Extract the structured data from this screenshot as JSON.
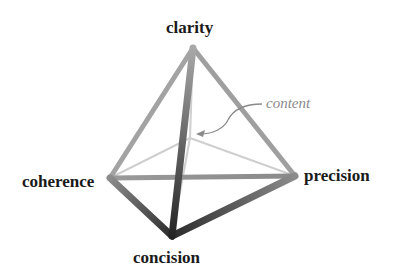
{
  "diagram": {
    "type": "tetrahedron",
    "vertices": {
      "top": {
        "label": "clarity"
      },
      "left": {
        "label": "coherence"
      },
      "right": {
        "label": "precision"
      },
      "bottom": {
        "label": "concision"
      }
    },
    "center": {
      "label": "content"
    },
    "colors": {
      "edge_light": "#c8c8c8",
      "edge_mid": "#8c8c8c",
      "edge_dark": "#3a3a3a",
      "annotation": "#8a8a8a",
      "label": "#1a1a1a"
    }
  }
}
